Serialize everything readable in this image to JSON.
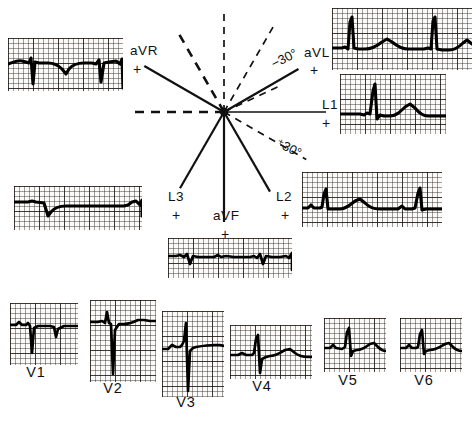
{
  "figure": {
    "ink_color": "#111111",
    "paper_color": "#f2f0ee",
    "grid_color": "#3c3632"
  },
  "axis_diagram": {
    "center": {
      "x": 224,
      "y": 112
    },
    "angle_labels": [
      {
        "name": "minus-30-degrees",
        "text": "−30°",
        "x": 272,
        "y": 58,
        "rotate": -27
      },
      {
        "name": "plus-30-degrees",
        "text": "⁺30°",
        "x": 277,
        "y": 135,
        "rotate": 27
      }
    ],
    "lead_labels": [
      {
        "name": "aVR",
        "text": "aVR",
        "x": 130,
        "y": 44,
        "polarity": "+",
        "plus_x": 133,
        "plus_y": 62
      },
      {
        "name": "aVL",
        "text": "aVL",
        "x": 304,
        "y": 46,
        "polarity": "+",
        "plus_x": 310,
        "plus_y": 63
      },
      {
        "name": "L1",
        "text": "L1",
        "x": 322,
        "y": 98,
        "polarity": "+",
        "plus_x": 322,
        "plus_y": 116
      },
      {
        "name": "L2",
        "text": "L2",
        "x": 276,
        "y": 190,
        "polarity": "+",
        "plus_x": 281,
        "plus_y": 208
      },
      {
        "name": "L3",
        "text": "L3",
        "x": 168,
        "y": 190,
        "polarity": "+",
        "plus_x": 172,
        "plus_y": 208
      },
      {
        "name": "aVF",
        "text": "aVF",
        "x": 213,
        "y": 209,
        "polarity": "+",
        "plus_x": 221,
        "plus_y": 227
      }
    ]
  },
  "strips": [
    {
      "id": "avr",
      "lead": "aVR",
      "name": "ecg-strip-avr",
      "x": 8,
      "y": 38,
      "w": 115,
      "h": 53,
      "description": "aVR rhythm strip — predominantly negative QRS deflections"
    },
    {
      "id": "avl",
      "lead": "aVL",
      "name": "ecg-strip-avl",
      "x": 332,
      "y": 8,
      "w": 140,
      "h": 62,
      "description": "aVL strip — tall upright R waves"
    },
    {
      "id": "l1",
      "lead": "L1",
      "name": "ecg-strip-l1",
      "x": 340,
      "y": 74,
      "w": 106,
      "h": 60,
      "description": "Lead I strip — upright QRS with positive T wave"
    },
    {
      "id": "l2",
      "lead": "L2",
      "name": "ecg-strip-l2",
      "x": 302,
      "y": 172,
      "w": 140,
      "h": 55,
      "description": "Lead II strip — small upright complexes"
    },
    {
      "id": "l3",
      "lead": "L3",
      "name": "ecg-strip-l3",
      "x": 14,
      "y": 186,
      "w": 128,
      "h": 44,
      "description": "Lead III strip — deep initial negative deflection"
    },
    {
      "id": "avf",
      "lead": "aVF",
      "name": "ecg-strip-avf",
      "x": 168,
      "y": 238,
      "w": 124,
      "h": 40,
      "description": "aVF strip — low-amplitude mainly negative complexes"
    },
    {
      "id": "v1",
      "lead": "V1",
      "name": "ecg-strip-v1",
      "x": 10,
      "y": 303,
      "w": 68,
      "h": 62,
      "label_x": 36,
      "label_y": 372,
      "description": "V1 — deep S waves, rS pattern"
    },
    {
      "id": "v2",
      "lead": "V2",
      "name": "ecg-strip-v2",
      "x": 90,
      "y": 300,
      "w": 66,
      "h": 82,
      "label_x": 113,
      "label_y": 388,
      "description": "V2 — very deep S wave"
    },
    {
      "id": "v3",
      "lead": "V3",
      "name": "ecg-strip-v3",
      "x": 162,
      "y": 311,
      "w": 62,
      "h": 86,
      "label_x": 186,
      "label_y": 402,
      "description": "V3 — deep S wave with transition"
    },
    {
      "id": "v4",
      "lead": "V4",
      "name": "ecg-strip-v4",
      "x": 230,
      "y": 325,
      "w": 82,
      "h": 54,
      "label_x": 262,
      "label_y": 386,
      "description": "V4 — R/S transition zone"
    },
    {
      "id": "v5",
      "lead": "V5",
      "name": "ecg-strip-v5",
      "x": 324,
      "y": 318,
      "w": 62,
      "h": 54,
      "label_x": 348,
      "label_y": 380,
      "description": "V5 — dominant R wave"
    },
    {
      "id": "v6",
      "lead": "V6",
      "name": "ecg-strip-v6",
      "x": 400,
      "y": 318,
      "w": 62,
      "h": 54,
      "label_x": 424,
      "label_y": 380,
      "description": "V6 — dominant R wave with upright T"
    }
  ],
  "waveforms": {
    "avr": "M0,26 C6,24 10,22 14,23 L18,24 L21,25 L23,20 L25,46 L27,24 L31,25 L40,25 C46,25 50,27 54,31 L58,36 L61,31 C65,26 70,25 76,25 L84,25 L88,26 L91,22 L93,44 L96,25 L101,24 L108,23 L112,26 L114,21 L115,50",
    "avl": "M0,40 L10,40 L13,39 L16,41 L18,14 L20,9 L22,40 L26,41 L33,41 C40,41 45,38 50,34 L55,31 L60,34 C65,38 70,41 76,41 L84,41 L92,41 L96,40 L99,41 L101,13 L103,9 L105,41 L110,42 L117,42 C123,42 127,39 131,35 L135,32 L140,36",
    "l1": "M0,40 L14,40 L20,40 L24,41 L27,39 L30,40 L33,17 L35,10 L37,45 L40,41 L44,42 L50,42 C56,42 60,38 65,33 L70,30 L75,34 C79,39 83,42 88,42 L98,42 L106,42",
    "l2": "M0,36 L6,36 L9,33 L12,36 L18,36 L20,35 L22,22 L24,17 L26,37 L30,37 L38,37 C44,37 48,33 53,29 L58,27 L63,31 C67,35 71,37 77,37 L88,37 L96,37 L100,34 L103,37 L110,37 L113,36 L116,21 L118,16 L120,38 L124,37 L132,37 L140,37",
    "l3": "M0,16 L14,16 L18,15 L22,16 L30,17 L34,30 L37,26 C41,21 46,20 52,20 L62,20 L72,20 L80,20 L88,20 L96,20 L104,20 L110,20 L114,19 L118,16 L122,15 L126,19 L128,14 L128,30",
    "avf": "M0,18 L8,18 L12,17 L16,19 L19,16 L22,26 L25,18 L30,19 L38,19 L46,19 L50,17 L53,19 L58,18 L66,19 L74,19 L82,19 L86,18 L89,20 L92,16 L95,26 L98,18 L104,19 L112,19 L118,18 L121,20 L124,15 L124,32",
    "v1": "M0,22 L6,22 L9,19 L12,22 L16,22 L18,20 L20,23 L22,50 L24,25 L28,23 L34,23 L40,23 L44,24 L46,34 L48,26 L54,23 L62,23 L68,23",
    "v2": "M0,22 L8,22 L12,21 L15,23 L17,12 L19,23 L21,24 L23,74 L25,30 L29,24 L34,24 C40,24 44,22 48,20 L54,20 L60,21 L66,21",
    "v3": "M0,38 L6,38 L10,34 L14,36 L18,36 L20,34 L22,30 L24,12 L26,80 L28,40 L31,37 L34,36 C40,35 46,34 52,34 L58,34 L62,35",
    "v4": "M0,30 L8,30 L12,28 L16,30 L22,30 L24,28 L26,14 L28,10 L30,48 L32,34 L36,32 L40,31 C46,31 50,28 55,25 L60,24 L65,28 C69,31 73,32 78,32 L82,32",
    "v5": "M0,30 L6,30 L9,27 L12,30 L18,31 L21,29 L23,14 L25,10 L27,38 L29,33 L33,32 C38,32 42,29 46,26 L50,25 L54,29 C57,32 60,33 62,33",
    "v6": "M0,30 L6,30 L9,27 L12,30 L16,30 L18,29 L20,16 L22,12 L24,36 L26,33 L30,32 C36,32 40,29 45,26 L49,25 L53,29 C56,32 59,33 62,33"
  },
  "viewboxes": {
    "avr": "0 0 115 53",
    "avl": "0 0 140 62",
    "l1": "0 0 106 60",
    "l2": "0 0 140 55",
    "l3": "0 0 128 44",
    "avf": "0 0 124 40",
    "v1": "0 0 68 62",
    "v2": "0 0 66 82",
    "v3": "0 0 62 86",
    "v4": "0 0 82 54",
    "v5": "0 0 62 54",
    "v6": "0 0 62 54"
  }
}
